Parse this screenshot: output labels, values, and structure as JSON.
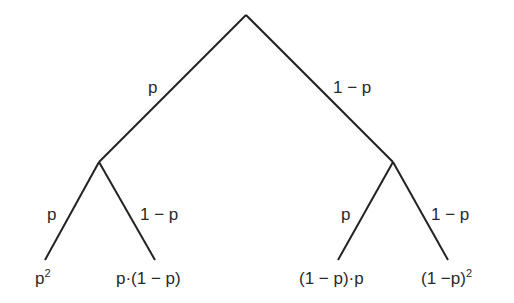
{
  "diagram": {
    "type": "probability-tree",
    "colors": {
      "line": "#222222",
      "text": "#2a2a2a",
      "background": "#ffffff"
    },
    "nodes": {
      "root": {
        "x": 246,
        "y": 15
      },
      "left": {
        "x": 99,
        "y": 162
      },
      "right": {
        "x": 393,
        "y": 162
      },
      "leaf_ll": {
        "x": 45,
        "y": 260
      },
      "leaf_lr": {
        "x": 155,
        "y": 260
      },
      "leaf_rl": {
        "x": 338,
        "y": 260
      },
      "leaf_rr": {
        "x": 448,
        "y": 260
      }
    },
    "branches": {
      "root_left": "p",
      "root_right": "1 − p",
      "left_left": "p",
      "left_right": "1 − p",
      "right_left": "p",
      "right_right": "1 − p"
    },
    "outcomes": {
      "ll": {
        "base": "p",
        "exp": "2"
      },
      "lr": {
        "text": "p·(1 − p)"
      },
      "rl": {
        "text": "(1 − p)·p"
      },
      "rr": {
        "base": "(1 −p)",
        "exp": "2"
      }
    }
  }
}
